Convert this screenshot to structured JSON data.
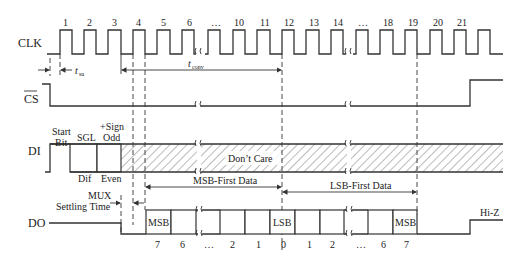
{
  "signals": {
    "clk": "CLK",
    "cs": "CS",
    "di": "DI",
    "do": "DO"
  },
  "clk_pulses": [
    "1",
    "2",
    "3",
    "4",
    "5",
    "6",
    "…",
    "10",
    "11",
    "12",
    "13",
    "14",
    "…",
    "18",
    "19",
    "20",
    "21"
  ],
  "timing": {
    "t_su": "t",
    "t_su_sub": "su",
    "t_conv": "t",
    "t_conv_sub": "conv",
    "mux_line1": "MUX",
    "mux_line2": "Settling Time"
  },
  "di": {
    "start_line1": "Start",
    "start_line2": "Bit",
    "sgl": "SGL",
    "dif": "Dif",
    "sign_line1": "+Sign",
    "sign_line2": "Odd",
    "even": "Even",
    "dont_care": "Don’t Care"
  },
  "data_ranges": {
    "msb_first": "MSB-First Data",
    "lsb_first": "LSB-First Data"
  },
  "do": {
    "msb_left": "MSB",
    "lsb": "LSB",
    "msb_right": "MSB",
    "hiz": "Hi-Z",
    "bit_labels": [
      "7",
      "6",
      "…",
      "2",
      "1",
      "0",
      "1",
      "2",
      "…",
      "6",
      "7"
    ]
  }
}
